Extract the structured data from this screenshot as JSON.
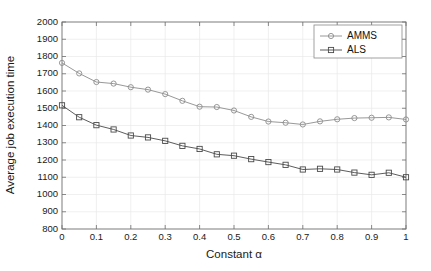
{
  "chart_data": {
    "type": "line",
    "title": "",
    "xlabel": "Constant α",
    "ylabel": "Average job execution time",
    "xlim": [
      0,
      1
    ],
    "ylim": [
      800,
      2000
    ],
    "xticks": [
      0,
      0.1,
      0.2,
      0.3,
      0.4,
      0.5,
      0.6,
      0.7,
      0.8,
      0.9,
      1
    ],
    "xticklabels": [
      "0",
      "0.1",
      "0.2",
      "0.3",
      "0.4",
      "0.5",
      "0.6",
      "0.7",
      "0.8",
      "0.9",
      "1"
    ],
    "yticks": [
      800,
      900,
      1000,
      1100,
      1200,
      1300,
      1400,
      1500,
      1600,
      1700,
      1800,
      1900,
      2000
    ],
    "yticklabels": [
      "800",
      "900",
      "1000",
      "1100",
      "1200",
      "1300",
      "1400",
      "1500",
      "1600",
      "1700",
      "1800",
      "1900",
      "2000"
    ],
    "grid": true,
    "legend_position": "upper right",
    "x": [
      0,
      0.05,
      0.1,
      0.15,
      0.2,
      0.25,
      0.3,
      0.35,
      0.4,
      0.45,
      0.5,
      0.55,
      0.6,
      0.65,
      0.7,
      0.75,
      0.8,
      0.85,
      0.9,
      0.95,
      1
    ],
    "series": [
      {
        "name": "AMMS",
        "marker": "circle",
        "color": "#8c8c8c",
        "values": [
          1763,
          1702,
          1652,
          1643,
          1622,
          1608,
          1582,
          1543,
          1509,
          1507,
          1487,
          1450,
          1423,
          1416,
          1406,
          1424,
          1436,
          1443,
          1445,
          1447,
          1435
        ]
      },
      {
        "name": "ALS",
        "marker": "square",
        "color": "#4a4a4a",
        "values": [
          1517,
          1448,
          1402,
          1377,
          1342,
          1331,
          1311,
          1282,
          1264,
          1233,
          1225,
          1205,
          1188,
          1172,
          1145,
          1149,
          1145,
          1127,
          1114,
          1126,
          1100
        ]
      }
    ]
  },
  "legend": {
    "entries": [
      {
        "label": "AMMS"
      },
      {
        "label": "ALS"
      }
    ]
  },
  "colors": {
    "axis": "#6e6e6e",
    "grid": "#e9e9e9",
    "text": "#1a1a1a",
    "background": "#ffffff"
  }
}
